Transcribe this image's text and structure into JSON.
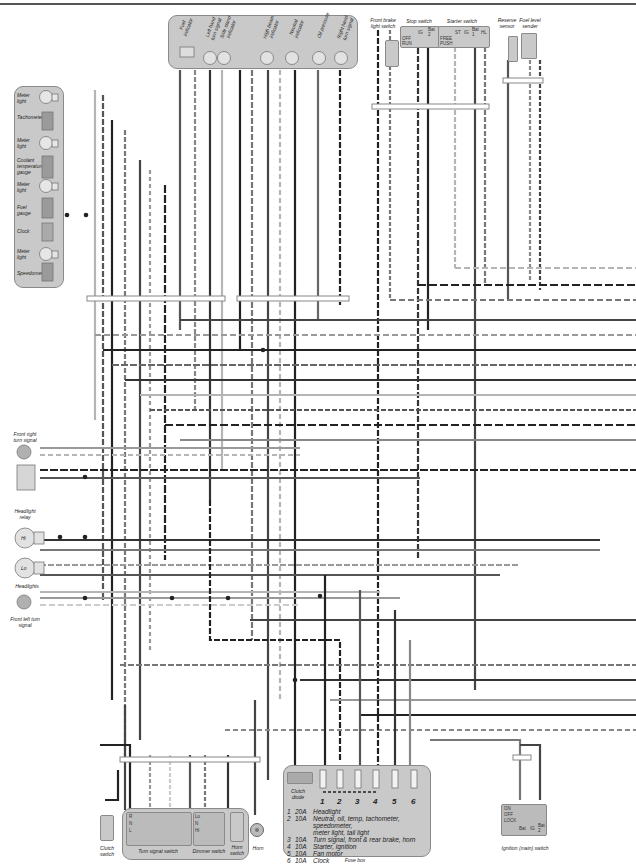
{
  "diagram": {
    "type": "motorcycle wiring diagram (partial)",
    "instrument_cluster": {
      "items": [
        "Meter light",
        "Tachometer",
        "Meter light",
        "Coolant temperature gauge",
        "Meter light",
        "Fuel gauge",
        "Clock",
        "Meter light",
        "Speedometer"
      ]
    },
    "indicator_panel": {
      "items": [
        "Fuel indicator",
        "Left hand turn signal",
        "Side stand indicator",
        "High beam indicator",
        "Neutral indicator",
        "Oil pressure",
        "Right hand turn signal"
      ]
    },
    "top_right_components": {
      "front_brake_light_switch": "Front brake light switch",
      "stop_switch": {
        "label": "Stop switch",
        "columns": [
          "IG",
          "Bat 2"
        ],
        "rows": [
          "OFF",
          "RUN"
        ]
      },
      "starter_switch": {
        "label": "Starter switch",
        "columns": [
          "ST",
          "IG",
          "Bat 1",
          "HL"
        ],
        "rows": [
          "FREE",
          "PUSH"
        ]
      },
      "reserve_sensor": "Reserve sensor",
      "fuel_level_sender": "Fuel level sender"
    },
    "left_components": {
      "front_right_turn_signal": "Front right turn signal",
      "headlight_relay": "Headlight relay",
      "headlight_hi": "Hi",
      "headlight_lo": "Lo",
      "headlights": "Headlights",
      "front_left_turn_signal": "Front left turn signal"
    },
    "bottom_components": {
      "clutch_switch": "Clutch switch",
      "turn_signal_switch": {
        "label": "Turn signal switch",
        "rows": [
          "R",
          "N",
          "L"
        ],
        "columns": [
          "Bat 2",
          "PR",
          "PL",
          "W",
          "R",
          "L"
        ]
      },
      "dimmer_switch": {
        "label": "Dimmer switch",
        "rows": [
          "Lo",
          "N",
          "Hi"
        ],
        "columns": [
          "HL",
          "Lo",
          "Hi"
        ]
      },
      "horn_switch": "Horn switch",
      "horn": "Horn",
      "clutch_diode": "Clutch diode",
      "ignition_switch": {
        "label": "Ignition (main) switch",
        "rows": [
          "ON",
          "OFF",
          "LOCK"
        ],
        "columns": [
          "Bat",
          "IG",
          "Bat 2"
        ]
      }
    },
    "fuse_box": {
      "label": "Fuse box",
      "fuse_numbers": [
        "1",
        "2",
        "3",
        "4",
        "5",
        "6"
      ],
      "fuses": [
        {
          "n": "1",
          "amp": "20A",
          "desc": "Headlight"
        },
        {
          "n": "2",
          "amp": "10A",
          "desc": "Neutral, oil, temp, tachometer, speedometer,"
        },
        {
          "n": "",
          "amp": "",
          "desc": "meter light, tail light"
        },
        {
          "n": "3",
          "amp": "10A",
          "desc": "Turn signal, front & rear brake, horn"
        },
        {
          "n": "4",
          "amp": "10A",
          "desc": "Starter, ignition"
        },
        {
          "n": "5",
          "amp": "10A",
          "desc": "Fan motor"
        },
        {
          "n": "6",
          "amp": "10A",
          "desc": "Clock"
        }
      ]
    },
    "colors": {
      "panel": "#c9c9c9",
      "wire_dark": "#222222",
      "wire_mid": "#6e6e6e",
      "wire_light": "#b5b5b5"
    }
  }
}
